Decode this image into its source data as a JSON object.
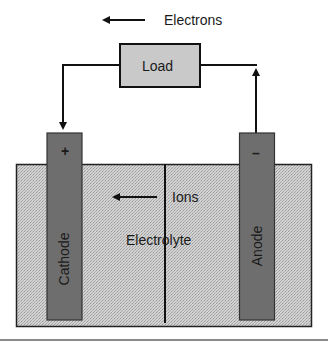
{
  "diagram": {
    "type": "electrochemical-cell",
    "electron_flow": {
      "label": "Electrons",
      "direction": "left"
    },
    "load": {
      "label": "Load",
      "fill": "#c9c9c9"
    },
    "cathode": {
      "label": "Cathode",
      "sign": "+",
      "fill": "#6e6e6e"
    },
    "anode": {
      "label": "Anode",
      "sign": "–",
      "fill": "#6e6e6e"
    },
    "electrolyte": {
      "label": "Electrolyte",
      "fill": "#c6c6c6"
    },
    "ion_flow": {
      "label": "Ions",
      "direction": "left"
    },
    "separator": {
      "present": true
    }
  }
}
